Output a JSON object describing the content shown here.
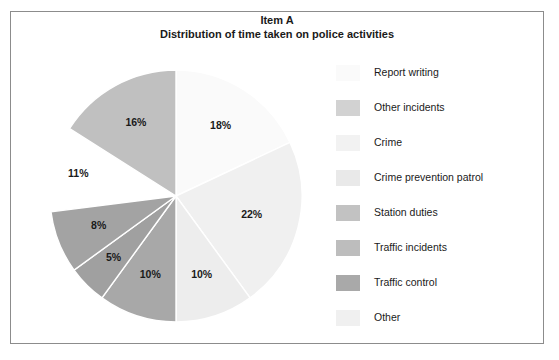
{
  "figure": {
    "title_line1": "Item A",
    "title_line2": "Distribution of time taken on police activities",
    "background": "#ffffff",
    "frame_color": "#8c8c8c"
  },
  "chart_data": {
    "type": "pie",
    "title": "Distribution of time taken on police activities",
    "subtitle": "Item A",
    "xlabel": "",
    "ylabel": "",
    "legend_position": "right",
    "grid": false,
    "units": "percent",
    "total": 100,
    "start_angle_deg": 0,
    "direction": "clockwise",
    "categories": [
      "Report writing",
      "Other incidents",
      "Crime",
      "Crime prevention patrol",
      "Station duties",
      "Traffic incidents",
      "Traffic control",
      "Other"
    ],
    "values": [
      18,
      22,
      10,
      10,
      5,
      8,
      11,
      16
    ],
    "labels": [
      "18%",
      "22%",
      "10%",
      "10%",
      "5%",
      "8%",
      "11%",
      "16%"
    ],
    "colors": [
      "#fafafa",
      "#f0f0f0",
      "#ededed",
      "#e6e6e6",
      "#a8a8a8",
      "#a0a0a0",
      "#ffffff",
      "#c0c0c0"
    ],
    "slice_border": "#ffffff",
    "exploded": [
      "Traffic control"
    ],
    "slices": [
      {
        "label": "Report writing",
        "value": 18,
        "display": "18%",
        "color": "#fafafa"
      },
      {
        "label": "Other incidents",
        "value": 22,
        "display": "22%",
        "color": "#f0f0f0"
      },
      {
        "label": "Crime",
        "value": 10,
        "display": "10%",
        "color": "#ededed"
      },
      {
        "label": "Crime prevention patrol",
        "value": 10,
        "display": "10%",
        "color": "#a8a8a8"
      },
      {
        "label": "Station duties",
        "value": 5,
        "display": "5%",
        "color": "#a0a0a0"
      },
      {
        "label": "Traffic incidents",
        "value": 8,
        "display": "8%",
        "color": "#a3a3a3"
      },
      {
        "label": "Traffic control",
        "value": 11,
        "display": "11%",
        "color": "#ffffff"
      },
      {
        "label": "Other",
        "value": 16,
        "display": "16%",
        "color": "#c0c0c0"
      }
    ]
  },
  "legend": {
    "items": [
      {
        "label": "Report writing",
        "color": "#fafafa"
      },
      {
        "label": "Other incidents",
        "color": "#d2d2d2"
      },
      {
        "label": "Crime",
        "color": "#f2f2f2"
      },
      {
        "label": "Crime prevention patrol",
        "color": "#e9e9e9"
      },
      {
        "label": "Station duties",
        "color": "#c2c2c2"
      },
      {
        "label": "Traffic incidents",
        "color": "#bdbdbd"
      },
      {
        "label": "Traffic control",
        "color": "#a9a9a9"
      },
      {
        "label": "Other",
        "color": "#f0f0f0"
      }
    ]
  }
}
